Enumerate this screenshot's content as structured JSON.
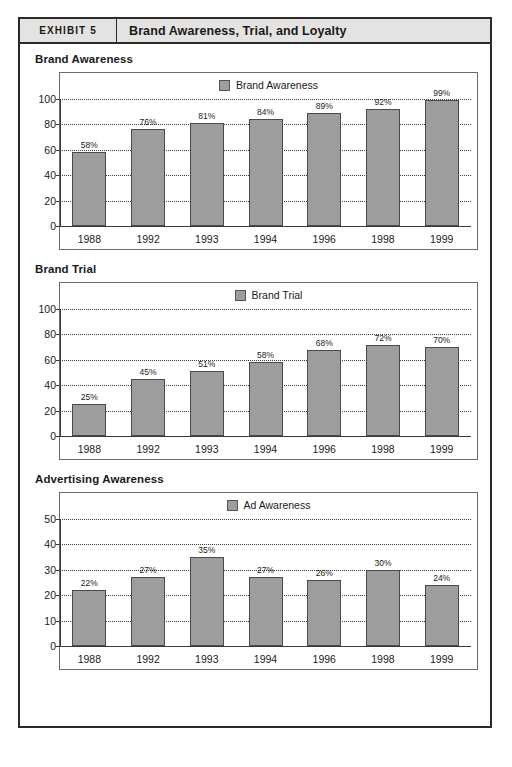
{
  "exhibit": {
    "tag": "EXHIBIT 5",
    "title": "Brand Awareness, Trial, and Loyalty",
    "border_color": "#2a2a2a",
    "header_bg": "#e4e3e1"
  },
  "style": {
    "bar_fill": "#9d9d9d",
    "bar_border": "#4a4a4a",
    "gridline_color": "#3a3a3a"
  },
  "charts": [
    {
      "heading": "Brand Awareness",
      "legend": "Brand Awareness"
    },
    {
      "heading": "Brand Trial",
      "legend": "Brand Trial"
    },
    {
      "heading": "Advertising Awareness",
      "legend": "Ad Awareness"
    }
  ],
  "chart_data": [
    {
      "type": "bar",
      "title": "Brand Awareness",
      "categories": [
        "1988",
        "1992",
        "1993",
        "1994",
        "1996",
        "1998",
        "1999"
      ],
      "values": [
        58,
        76,
        81,
        84,
        89,
        92,
        99
      ],
      "value_labels": [
        "58%",
        "76%",
        "81%",
        "84%",
        "89%",
        "92%",
        "99%"
      ],
      "series": [
        {
          "name": "Brand Awareness",
          "values": [
            58,
            76,
            81,
            84,
            89,
            92,
            99
          ]
        }
      ],
      "xlabel": "",
      "ylabel": "",
      "ylim": [
        0,
        100
      ],
      "yticks": [
        0,
        20,
        40,
        60,
        80,
        100
      ],
      "ytick_labels": [
        "0",
        "20",
        "40",
        "60",
        "80",
        "100"
      ],
      "grid": true,
      "legend_position": "top-center"
    },
    {
      "type": "bar",
      "title": "Brand Trial",
      "categories": [
        "1988",
        "1992",
        "1993",
        "1994",
        "1996",
        "1998",
        "1999"
      ],
      "values": [
        25,
        45,
        51,
        58,
        68,
        72,
        70
      ],
      "value_labels": [
        "25%",
        "45%",
        "51%",
        "58%",
        "68%",
        "72%",
        "70%"
      ],
      "series": [
        {
          "name": "Brand Trial",
          "values": [
            25,
            45,
            51,
            58,
            68,
            72,
            70
          ]
        }
      ],
      "xlabel": "",
      "ylabel": "",
      "ylim": [
        0,
        100
      ],
      "yticks": [
        0,
        20,
        40,
        60,
        80,
        100
      ],
      "ytick_labels": [
        "0",
        "20",
        "40",
        "60",
        "80",
        "100"
      ],
      "grid": true,
      "legend_position": "top-center"
    },
    {
      "type": "bar",
      "title": "Advertising Awareness",
      "categories": [
        "1988",
        "1992",
        "1993",
        "1994",
        "1996",
        "1998",
        "1999"
      ],
      "values": [
        22,
        27,
        35,
        27,
        26,
        30,
        24
      ],
      "value_labels": [
        "22%",
        "27%",
        "35%",
        "27%",
        "26%",
        "30%",
        "24%"
      ],
      "series": [
        {
          "name": "Ad Awareness",
          "values": [
            22,
            27,
            35,
            27,
            26,
            30,
            24
          ]
        }
      ],
      "xlabel": "",
      "ylabel": "",
      "ylim": [
        0,
        50
      ],
      "yticks": [
        0,
        10,
        20,
        30,
        40,
        50
      ],
      "ytick_labels": [
        "0",
        "10",
        "20",
        "30",
        "40",
        "50"
      ],
      "grid": true,
      "legend_position": "top-center"
    }
  ]
}
